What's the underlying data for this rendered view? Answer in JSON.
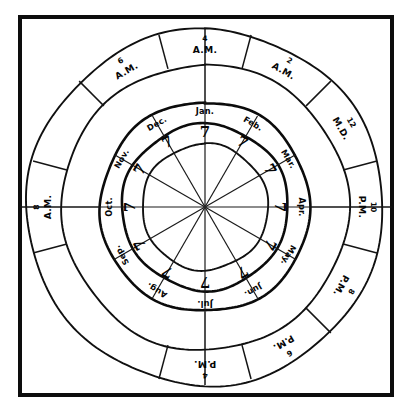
{
  "figure": {
    "center_value": "",
    "colors": {
      "ink": "#0d0d0d",
      "paper": "#ffffff"
    },
    "geometry": {
      "center_x": 205,
      "center_y": 207,
      "radius_inner": 63,
      "radius_number_ring": 83,
      "radius_month_ring": 105,
      "radius_hour_ring": 143,
      "radius_outer": 178,
      "sectors": 12
    }
  },
  "frame": {
    "x": 20,
    "y": 17,
    "width": 372,
    "height": 378
  },
  "months": [
    {
      "label": "Jan.",
      "value": "7",
      "angle_deg": 0
    },
    {
      "label": "Feb.",
      "value": "7",
      "angle_deg": 30
    },
    {
      "label": "Mar.",
      "value": "7",
      "angle_deg": 60
    },
    {
      "label": "Apr.",
      "value": "7",
      "angle_deg": 90
    },
    {
      "label": "May.",
      "value": "7",
      "angle_deg": 120
    },
    {
      "label": "Jun.",
      "value": "7",
      "angle_deg": 150
    },
    {
      "label": "Jul.",
      "value": "7",
      "angle_deg": 180
    },
    {
      "label": "Aug.",
      "value": "7",
      "angle_deg": 210
    },
    {
      "label": "Sep.",
      "value": "7",
      "angle_deg": 240
    },
    {
      "label": "Oct.",
      "value": "7",
      "angle_deg": 270
    },
    {
      "label": "Nov.",
      "value": "7",
      "angle_deg": 300
    },
    {
      "label": "Dec.",
      "value": "7",
      "angle_deg": 330
    }
  ],
  "hours": [
    {
      "number": "4",
      "period": "A.M.",
      "angle_deg": 0
    },
    {
      "number": "2",
      "period": "A.M.",
      "angle_deg": 30
    },
    {
      "number": "12",
      "period": "M.D.",
      "angle_deg": 60
    },
    {
      "number": "10",
      "period": "P.M.",
      "angle_deg": 90
    },
    {
      "number": "8",
      "period": "P.M.",
      "angle_deg": 120
    },
    {
      "number": "6",
      "period": "P.M.",
      "angle_deg": 150
    },
    {
      "number": "4",
      "period": "P.M.",
      "angle_deg": 180
    },
    {
      "number": "8",
      "period": "A.M.",
      "angle_deg": 270
    },
    {
      "number": "6",
      "period": "A.M.",
      "angle_deg": 330
    }
  ]
}
